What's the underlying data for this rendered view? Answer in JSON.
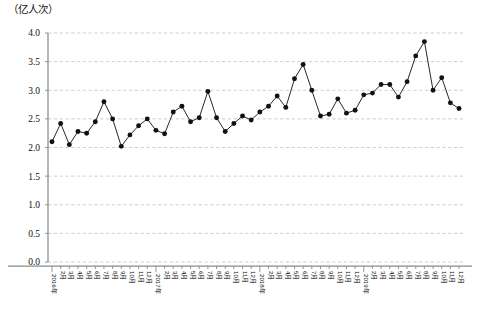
{
  "chart_data": {
    "type": "line",
    "title": "",
    "subtitle": "",
    "unit_label": "（亿人次）",
    "xlabel": "",
    "ylabel": "",
    "ylim": [
      0.0,
      4.0
    ],
    "ytick_step": 0.5,
    "ytick_labels": [
      "0.0",
      "0.5",
      "1.0",
      "1.5",
      "2.0",
      "2.5",
      "3.0",
      "3.5",
      "4.0"
    ],
    "ytick_values": [
      0.0,
      0.5,
      1.0,
      1.5,
      2.0,
      2.5,
      3.0,
      3.5,
      4.0
    ],
    "grid": "horizontal-dashed",
    "legend": "none",
    "legend_position": "none",
    "marker": "filled-circle",
    "line_color": "#1c1c1c",
    "marker_color": "#111111",
    "grid_color": "#b9b9b9",
    "axis_color": "#8a8a8a",
    "xtick_rotation": 90,
    "categories": [
      "2016年",
      "2月",
      "3月",
      "4月",
      "5月",
      "6月",
      "7月",
      "8月",
      "9月",
      "10月",
      "11月",
      "12月",
      "2017年",
      "2月",
      "3月",
      "4月",
      "5月",
      "6月",
      "7月",
      "8月",
      "9月",
      "10月",
      "11月",
      "12月",
      "2018年",
      "2月",
      "3月",
      "4月",
      "5月",
      "6月",
      "7月",
      "8月",
      "9月",
      "10月",
      "11月",
      "12月",
      "2019年",
      "2月",
      "3月",
      "4月",
      "5月",
      "6月",
      "7月",
      "8月",
      "9月",
      "10月",
      "11月",
      "12月"
    ],
    "year_marker_indices": [
      0,
      12,
      24,
      36
    ],
    "values": [
      2.1,
      2.42,
      2.05,
      2.28,
      2.25,
      2.45,
      2.8,
      2.5,
      2.02,
      2.22,
      2.38,
      2.5,
      2.3,
      2.24,
      2.62,
      2.72,
      2.45,
      2.52,
      2.98,
      2.52,
      2.28,
      2.42,
      2.55,
      2.48,
      2.62,
      2.72,
      2.9,
      2.7,
      3.2,
      3.45,
      3.0,
      2.55,
      2.58,
      2.85,
      2.6,
      2.65,
      2.92,
      2.95,
      3.1,
      3.1,
      2.88,
      3.15,
      3.6,
      3.85,
      3.0,
      3.22,
      2.78,
      2.68
    ],
    "series": [
      {
        "name": "旅客运输量",
        "values": [
          2.1,
          2.42,
          2.05,
          2.28,
          2.25,
          2.45,
          2.8,
          2.5,
          2.02,
          2.22,
          2.38,
          2.5,
          2.3,
          2.24,
          2.62,
          2.72,
          2.45,
          2.52,
          2.98,
          2.52,
          2.28,
          2.42,
          2.55,
          2.48,
          2.62,
          2.72,
          2.9,
          2.7,
          3.2,
          3.45,
          3.0,
          2.55,
          2.58,
          2.85,
          2.6,
          2.65,
          2.92,
          2.95,
          3.1,
          3.1,
          2.88,
          3.15,
          3.6,
          3.85,
          3.0,
          3.22,
          2.78,
          2.68
        ]
      }
    ],
    "annotations": [],
    "max_value": 3.85,
    "max_category": "2019年8月",
    "min_value": 2.02,
    "min_category": "2016年9月"
  },
  "layout": {
    "plot_left": 48,
    "plot_right": 465,
    "plot_top": 33,
    "plot_bottom": 262
  }
}
